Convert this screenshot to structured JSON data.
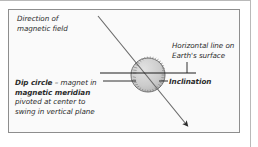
{
  "figure": {
    "name": "dip-circle-inclination-diagram",
    "background_color": "#fafafa",
    "border_color": "#8e8e8e",
    "ink_color": "#2b2b2b"
  },
  "labels": {
    "field_direction": {
      "line1": "Direction of",
      "line2": "magnetic field"
    },
    "horizontal_line": {
      "line1": "Horizontal line on",
      "line2": "Earth's surface"
    },
    "dip_circle": {
      "bold1": "Dip circle",
      "plain1": " – magnet in",
      "bold2": "magnetic meridian",
      "line3": "pivoted at center to",
      "line4": "swing in vertical plane"
    },
    "inclination": "Inclination"
  },
  "graphics": {
    "dial": {
      "center_x": 148,
      "center_y": 75,
      "radius": 17,
      "fill_color": "#c9c9c9",
      "edge_color": "#6f6f6f",
      "tick_count": 36
    },
    "field_arrow": {
      "x1": 98,
      "y1": 16,
      "x2": 186,
      "y2": 124,
      "color": "#6a6a6a"
    },
    "horizon_line": {
      "x1": 100,
      "y1": 73,
      "x2": 196,
      "y2": 73,
      "color": "#1c1c1c"
    },
    "dip_leader": {
      "x1": 103,
      "y1": 81,
      "x2": 136,
      "y2": 81,
      "color": "#1c1c1c"
    },
    "horizontal_leader": {
      "x1": 187,
      "y1": 62,
      "x2": 187,
      "y2": 73,
      "color": "#1c1c1c"
    },
    "inclination_leader": {
      "x1": 159,
      "y1": 81,
      "x2": 168,
      "y2": 81,
      "color": "#1c1c1c"
    }
  }
}
